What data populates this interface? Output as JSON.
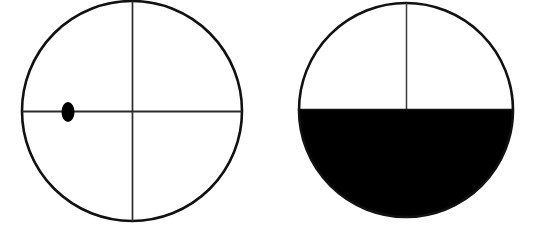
{
  "figure": {
    "background_color": "#ffffff",
    "width": 535,
    "height": 239,
    "stroke_color": "#111111",
    "fill_color": "#000000",
    "crosshair_color": "#333333"
  },
  "chart_data": {
    "type": "diagram",
    "xlabel": "",
    "ylabel": "",
    "grid": false,
    "legend": "none",
    "shapes": [
      {
        "name": "left-circle",
        "kind": "circle",
        "center_x": 132,
        "center_y": 111,
        "radius": 110,
        "outline_width": 2.6,
        "fill": "none",
        "crosshair": {
          "vertical": true,
          "horizontal": true,
          "line_width": 1.6
        },
        "marker": {
          "name": "dot-marker",
          "kind": "ellipse",
          "center_x": 68,
          "center_y": 112,
          "radius_x": 6.5,
          "radius_y": 10,
          "fill": "#000000"
        },
        "shaded_fraction": 0.0,
        "shaded_region": "none"
      },
      {
        "name": "right-circle",
        "kind": "circle",
        "center_x": 406,
        "center_y": 110,
        "radius": 107,
        "outline_width": 2.6,
        "fill": "none",
        "crosshair": {
          "vertical": true,
          "horizontal": true,
          "line_width": 1.6
        },
        "marker": null,
        "shaded_fraction": 0.5,
        "shaded_region": "lower-half"
      }
    ]
  }
}
